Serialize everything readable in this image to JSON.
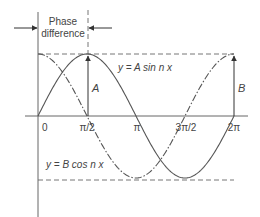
{
  "diagram": {
    "phase_label_line1": "Phase",
    "phase_label_line2": "difference",
    "sine_label": "y = A sin n x",
    "cosine_label": "y = B cos n x",
    "amplitude_A_label": "A",
    "amplitude_B_label": "B",
    "x_ticks": [
      "0",
      "π/2",
      "π",
      "3π/2",
      "2π"
    ],
    "colors": {
      "line": "#555555",
      "text": "#444444",
      "background": "#ffffff"
    }
  },
  "chart_data": {
    "type": "line",
    "title": "",
    "xlabel": "",
    "ylabel": "",
    "x_tick_labels": [
      "0",
      "π/2",
      "π",
      "3π/2",
      "2π"
    ],
    "series": [
      {
        "name": "y = A sin n x",
        "style": "solid",
        "function": "A*sin(x)",
        "x": [
          0,
          1.5708,
          3.1416,
          4.7124,
          6.2832
        ],
        "values": [
          0,
          1,
          0,
          -1,
          0
        ]
      },
      {
        "name": "y = B cos n x",
        "style": "dash-dot",
        "function": "B*cos(x)",
        "x": [
          0,
          1.5708,
          3.1416,
          4.7124,
          6.2832
        ],
        "values": [
          1,
          0,
          -1,
          0,
          1
        ]
      }
    ],
    "annotations": [
      "Phase difference (π/2) between x=0 and x=π/2",
      "A: amplitude arrow at x=π/2",
      "B: amplitude arrow at x=2π"
    ],
    "grid": false
  }
}
